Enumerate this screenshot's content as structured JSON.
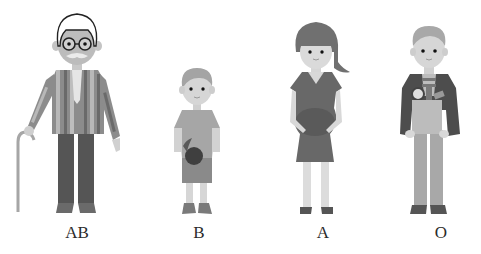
{
  "figures": [
    {
      "id": "grandfather",
      "label": "AB",
      "label_x": 77
    },
    {
      "id": "boy",
      "label": "B",
      "label_x": 199
    },
    {
      "id": "pregnant-woman",
      "label": "A",
      "label_x": 323
    },
    {
      "id": "man-with-bag",
      "label": "O",
      "label_x": 441
    }
  ],
  "colors": {
    "background": "#ffffff",
    "skin": "#d4d4d4",
    "dark_cloth": "#5a5a5a",
    "mid_cloth": "#8a8a8a",
    "light_cloth": "#b5b5b5",
    "hair_dark": "#6e6e6e",
    "hair_light": "#a8a8a8",
    "text": "#2b2b2b"
  }
}
